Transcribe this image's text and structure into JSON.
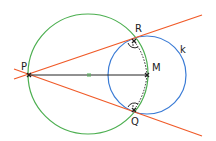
{
  "diagram": {
    "labels": {
      "P": "P",
      "R": "R",
      "M": "M",
      "Q": "Q",
      "k": "k"
    },
    "colors": {
      "green_circle": "#4caf50",
      "blue_circle": "#3a7bd5",
      "tangent_lines": "#f05a28",
      "segment": "#222222"
    }
  }
}
